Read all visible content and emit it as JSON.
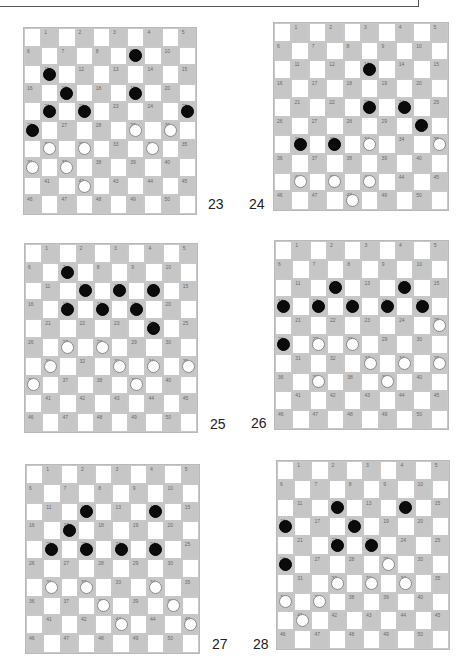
{
  "page": {
    "colors": {
      "dark_square": "#c6c6c6",
      "light_square": "#ffffff",
      "black_piece": "#0b0b0b",
      "white_piece": "#ffffff"
    }
  },
  "boards": [
    {
      "label": "23",
      "black": [
        9,
        11,
        17,
        19,
        21,
        22,
        25,
        26
      ],
      "white": [
        29,
        30,
        31,
        32,
        34,
        36,
        37,
        42
      ]
    },
    {
      "label": "24",
      "black": [
        13,
        23,
        24,
        30,
        31,
        32
      ],
      "white": [
        33,
        35,
        41,
        42,
        43,
        48
      ]
    },
    {
      "label": "25",
      "black": [
        7,
        12,
        13,
        14,
        17,
        18,
        19,
        24
      ],
      "white": [
        27,
        28,
        31,
        33,
        34,
        35,
        36,
        39
      ]
    },
    {
      "label": "26",
      "black": [
        12,
        14,
        16,
        17,
        18,
        19,
        20,
        26
      ],
      "white": [
        25,
        27,
        28,
        33,
        34,
        35,
        37,
        39
      ]
    },
    {
      "label": "27",
      "black": [
        12,
        14,
        17,
        21,
        22,
        23,
        24
      ],
      "white": [
        31,
        32,
        34,
        38,
        40,
        43,
        45
      ]
    },
    {
      "label": "28",
      "black": [
        12,
        14,
        16,
        18,
        22,
        23,
        26
      ],
      "white": [
        29,
        32,
        33,
        34,
        36,
        37,
        41
      ]
    }
  ]
}
